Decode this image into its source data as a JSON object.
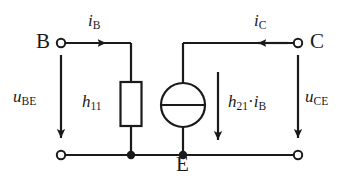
{
  "figure": {
    "background_color": "#ffffff",
    "line_color": "#1a1a1a"
  },
  "terminals": {
    "base": "B",
    "collector": "C",
    "emitter": "E"
  },
  "currents": {
    "base_current": "i",
    "base_current_sub": "B",
    "collector_current": "i",
    "collector_current_sub": "C"
  },
  "voltages": {
    "input_voltage": "u",
    "input_voltage_sub": "BE",
    "output_voltage": "u",
    "output_voltage_sub": "CE"
  },
  "components": {
    "input_resistance": "h",
    "input_resistance_sub": "11",
    "current_source_gain": "h",
    "current_source_gain_sub": "21",
    "current_source_operator": "·",
    "current_source_current": "i",
    "current_source_current_sub": "B"
  },
  "geometry": {
    "top_rail_y": 43,
    "bottom_rail_y": 155,
    "left_terminal_x": 61,
    "right_terminal_x": 298,
    "resistor_branch_x": 131,
    "source_branch_x": 183,
    "resistor_top_y": 82,
    "resistor_bottom_y": 126,
    "source_center_y": 105,
    "source_radius": 22
  }
}
